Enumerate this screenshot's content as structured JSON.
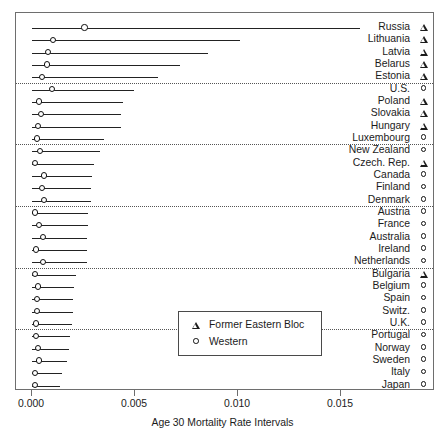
{
  "chart_data": {
    "type": "scatter",
    "subtype": "dot-plot-with-confidence-intervals",
    "title": "",
    "xlabel": "Age 30 Mortality Rate Intervals",
    "ylabel": "",
    "xlim": [
      -0.0008,
      0.0195
    ],
    "xticks": [
      0.0,
      0.005,
      0.01,
      0.015
    ],
    "xtick_labels": [
      "0.000",
      "0.005",
      "0.010",
      "0.015"
    ],
    "grid": false,
    "legend_position": "bottom-center-inside",
    "legend": [
      {
        "symbol": "triangle",
        "label": "Former Eastern Bloc"
      },
      {
        "symbol": "circle",
        "label": "Western"
      }
    ],
    "group_separators_after": [
      "Estonia",
      "Luxembourg",
      "Denmark",
      "Netherlands",
      "U.K."
    ],
    "categories": [
      "Russia",
      "Lithuania",
      "Latvia",
      "Belarus",
      "Estonia",
      "U.S.",
      "Poland",
      "Slovakia",
      "Hungary",
      "Luxembourg",
      "New Zealand",
      "Czech. Rep.",
      "Canada",
      "Finland",
      "Denmark",
      "Austria",
      "France",
      "Australia",
      "Ireland",
      "Netherlands",
      "Bulgaria",
      "Belgium",
      "Spain",
      "Switz.",
      "U.K.",
      "Portugal",
      "Norway",
      "Sweden",
      "Italy",
      "Japan"
    ],
    "rows": [
      {
        "label": "Russia",
        "group": "Former Eastern Bloc",
        "symbol": "triangle",
        "estimate": 0.00254,
        "low": 0.0,
        "high": 0.01592
      },
      {
        "label": "Lithuania",
        "group": "Former Eastern Bloc",
        "symbol": "triangle",
        "estimate": 0.00103,
        "low": 0.0,
        "high": 0.0101
      },
      {
        "label": "Latvia",
        "group": "Former Eastern Bloc",
        "symbol": "triangle",
        "estimate": 0.00078,
        "low": 0.0,
        "high": 0.00856
      },
      {
        "label": "Belarus",
        "group": "Former Eastern Bloc",
        "symbol": "triangle",
        "estimate": 0.00073,
        "low": 0.0,
        "high": 0.00718
      },
      {
        "label": "Estonia",
        "group": "Former Eastern Bloc",
        "symbol": "triangle",
        "estimate": 0.00049,
        "low": 0.0,
        "high": 0.0061
      },
      {
        "label": "U.S.",
        "group": "Western",
        "symbol": "circle",
        "estimate": 0.00098,
        "low": 0.0,
        "high": 0.00493
      },
      {
        "label": "Poland",
        "group": "Former Eastern Bloc",
        "symbol": "triangle",
        "estimate": 0.00034,
        "low": 0.0,
        "high": 0.0044
      },
      {
        "label": "Slovakia",
        "group": "Former Eastern Bloc",
        "symbol": "triangle",
        "estimate": 0.00044,
        "low": 0.0,
        "high": 0.00432
      },
      {
        "label": "Hungary",
        "group": "Former Eastern Bloc",
        "symbol": "triangle",
        "estimate": 0.00029,
        "low": 0.0,
        "high": 0.0043
      },
      {
        "label": "Luxembourg",
        "group": "Western",
        "symbol": "circle",
        "estimate": 0.00024,
        "low": 0.0,
        "high": 0.00349
      },
      {
        "label": "New Zealand",
        "group": "Western",
        "symbol": "circle",
        "estimate": 0.00039,
        "low": 0.0,
        "high": 0.0033
      },
      {
        "label": "Czech. Rep.",
        "group": "Former Eastern Bloc",
        "symbol": "triangle",
        "estimate": 0.00015,
        "low": 0.0,
        "high": 0.003
      },
      {
        "label": "Canada",
        "group": "Western",
        "symbol": "circle",
        "estimate": 0.00059,
        "low": 0.0,
        "high": 0.0029
      },
      {
        "label": "Finland",
        "group": "Western",
        "symbol": "circle",
        "estimate": 0.00049,
        "low": 0.0,
        "high": 0.00288
      },
      {
        "label": "Denmark",
        "group": "Western",
        "symbol": "circle",
        "estimate": 0.00059,
        "low": 0.0,
        "high": 0.00288
      },
      {
        "label": "Austria",
        "group": "Western",
        "symbol": "circle",
        "estimate": 0.00015,
        "low": 0.0,
        "high": 0.00273
      },
      {
        "label": "France",
        "group": "Western",
        "symbol": "circle",
        "estimate": 0.00034,
        "low": 0.0,
        "high": 0.0027
      },
      {
        "label": "Australia",
        "group": "Western",
        "symbol": "circle",
        "estimate": 0.00054,
        "low": 0.0,
        "high": 0.00268
      },
      {
        "label": "Ireland",
        "group": "Western",
        "symbol": "circle",
        "estimate": 0.0002,
        "low": 0.0,
        "high": 0.00268
      },
      {
        "label": "Netherlands",
        "group": "Western",
        "symbol": "circle",
        "estimate": 0.00054,
        "low": 0.0,
        "high": 0.00265
      },
      {
        "label": "Bulgaria",
        "group": "Former Eastern Bloc",
        "symbol": "triangle",
        "estimate": 0.00015,
        "low": 0.0,
        "high": 0.00215
      },
      {
        "label": "Belgium",
        "group": "Western",
        "symbol": "circle",
        "estimate": 0.00029,
        "low": 0.0,
        "high": 0.00205
      },
      {
        "label": "Spain",
        "group": "Western",
        "symbol": "circle",
        "estimate": 0.00024,
        "low": 0.0,
        "high": 0.002
      },
      {
        "label": "Switz.",
        "group": "Western",
        "symbol": "circle",
        "estimate": 0.00024,
        "low": 0.0,
        "high": 0.00198
      },
      {
        "label": "U.K.",
        "group": "Western",
        "symbol": "circle",
        "estimate": 0.0002,
        "low": 0.0,
        "high": 0.00195
      },
      {
        "label": "Portugal",
        "group": "Western",
        "symbol": "circle",
        "estimate": 0.0002,
        "low": 0.0,
        "high": 0.00185
      },
      {
        "label": "Norway",
        "group": "Western",
        "symbol": "circle",
        "estimate": 0.00029,
        "low": 0.0,
        "high": 0.0018
      },
      {
        "label": "Sweden",
        "group": "Western",
        "symbol": "circle",
        "estimate": 0.00034,
        "low": 0.0,
        "high": 0.0017
      },
      {
        "label": "Italy",
        "group": "Western",
        "symbol": "circle",
        "estimate": 0.00015,
        "low": 0.0,
        "high": 0.00145
      },
      {
        "label": "Japan",
        "group": "Western",
        "symbol": "circle",
        "estimate": 0.00015,
        "low": 0.0,
        "high": 0.00135
      }
    ]
  }
}
